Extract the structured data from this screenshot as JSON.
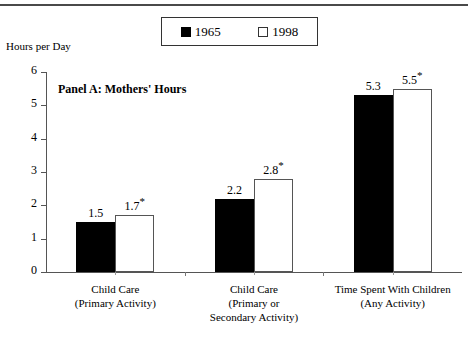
{
  "chart_data": {
    "type": "bar",
    "title": "Panel A: Mothers' Hours",
    "xlabel": "",
    "ylabel": "Hours per Day",
    "ylim": [
      0,
      6
    ],
    "yticks": [
      "0",
      "1",
      "2",
      "3",
      "4",
      "5",
      "6"
    ],
    "grid": false,
    "legend_position": "top-center",
    "categories": [
      "Child Care\n(Primary Activity)",
      "Child Care\n(Primary or\nSecondary Activity)",
      "Time Spent With Children\n(Any Activity)"
    ],
    "category_lines": [
      [
        "Child Care",
        "(Primary Activity)"
      ],
      [
        "Child Care",
        "(Primary or",
        "Secondary Activity)"
      ],
      [
        "Time Spent With Children",
        "(Any Activity)"
      ]
    ],
    "series": [
      {
        "name": "1965",
        "color": "#000000",
        "fill": "solid",
        "values": [
          1.5,
          2.2,
          5.3
        ],
        "labels": [
          "1.5",
          "2.2",
          "5.3"
        ],
        "significance": [
          "",
          "",
          ""
        ]
      },
      {
        "name": "1998",
        "color": "#ffffff",
        "fill": "hollow",
        "values": [
          1.7,
          2.8,
          5.5
        ],
        "labels": [
          "1.7",
          "2.8",
          "5.5"
        ],
        "significance": [
          "*",
          "*",
          "*"
        ]
      }
    ]
  },
  "legend": {
    "entries": [
      {
        "label": "1965",
        "swatch": "filled-square-icon"
      },
      {
        "label": "1998",
        "swatch": "hollow-square-icon"
      }
    ]
  },
  "axis": {
    "y_title": "Hours per Day",
    "y_ticks": [
      "6",
      "5",
      "4",
      "3",
      "2",
      "1",
      "0"
    ]
  },
  "panel": {
    "title": "Panel A: Mothers' Hours"
  }
}
